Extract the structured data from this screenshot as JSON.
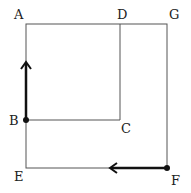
{
  "diagram": {
    "points": {
      "A": {
        "label": "A",
        "x": 26,
        "y": 24
      },
      "D": {
        "label": "D",
        "x": 120,
        "y": 24
      },
      "G": {
        "label": "G",
        "x": 167,
        "y": 24
      },
      "B": {
        "label": "B",
        "x": 26,
        "y": 120
      },
      "C": {
        "label": "C",
        "x": 120,
        "y": 120
      },
      "E": {
        "label": "E",
        "x": 26,
        "y": 168
      },
      "F": {
        "label": "F",
        "x": 167,
        "y": 168
      }
    },
    "shapes": [
      "square ABCD",
      "square AGFE"
    ],
    "arrows": [
      {
        "from": "B",
        "direction": "up"
      },
      {
        "from": "F",
        "direction": "left"
      }
    ]
  }
}
